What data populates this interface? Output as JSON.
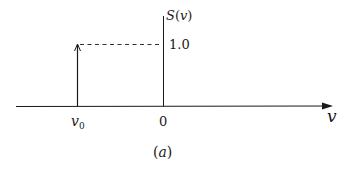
{
  "figure": {
    "caption": "(a)",
    "type": "diagram"
  },
  "axes": {
    "y_label": "S(v)",
    "x_label": "v",
    "origin_label": "0",
    "tick_value_label": "1.0"
  },
  "impulse": {
    "position_label": "v",
    "position_subscript": "0",
    "height": "1.0"
  },
  "colors": {
    "line": "#1a1a1a",
    "background": "#ffffff"
  }
}
